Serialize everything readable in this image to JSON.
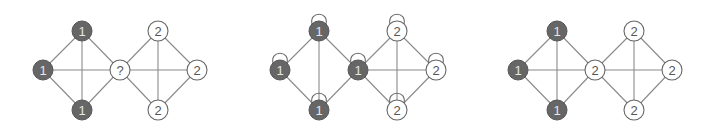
{
  "colors": {
    "dark_node_fill": "#666666",
    "light_node_fill": "#ffffff",
    "edge": "#8a8a8a"
  },
  "node_radius": 10,
  "graphs": [
    {
      "name": "graph-before",
      "nodes": [
        {
          "id": "a",
          "label": "1",
          "x": 82,
          "y": 31,
          "dark": true,
          "loop": false
        },
        {
          "id": "b",
          "label": "1",
          "x": 43,
          "y": 70,
          "dark": true,
          "loop": false
        },
        {
          "id": "c",
          "label": "1",
          "x": 82,
          "y": 110,
          "dark": true,
          "loop": false
        },
        {
          "id": "d",
          "label": "?",
          "x": 120,
          "y": 70,
          "dark": false,
          "loop": false
        },
        {
          "id": "e",
          "label": "2",
          "x": 158,
          "y": 31,
          "dark": false,
          "loop": false
        },
        {
          "id": "f",
          "label": "2",
          "x": 197,
          "y": 70,
          "dark": false,
          "loop": false
        },
        {
          "id": "g",
          "label": "2",
          "x": 158,
          "y": 110,
          "dark": false,
          "loop": false
        }
      ],
      "edges": [
        [
          "a",
          "b"
        ],
        [
          "a",
          "c"
        ],
        [
          "a",
          "d"
        ],
        [
          "b",
          "c"
        ],
        [
          "b",
          "d"
        ],
        [
          "c",
          "d"
        ],
        [
          "d",
          "e"
        ],
        [
          "d",
          "f"
        ],
        [
          "d",
          "g"
        ],
        [
          "e",
          "g"
        ],
        [
          "e",
          "f"
        ],
        [
          "f",
          "g"
        ]
      ]
    },
    {
      "name": "graph-with-self-loops",
      "nodes": [
        {
          "id": "a",
          "label": "1",
          "x": 319,
          "y": 31,
          "dark": true,
          "loop": true
        },
        {
          "id": "b",
          "label": "1",
          "x": 280,
          "y": 70,
          "dark": true,
          "loop": true
        },
        {
          "id": "c",
          "label": "1",
          "x": 319,
          "y": 110,
          "dark": true,
          "loop": true
        },
        {
          "id": "d",
          "label": "1",
          "x": 358,
          "y": 70,
          "dark": true,
          "loop": true
        },
        {
          "id": "e",
          "label": "2",
          "x": 397,
          "y": 31,
          "dark": false,
          "loop": true
        },
        {
          "id": "f",
          "label": "2",
          "x": 436,
          "y": 70,
          "dark": false,
          "loop": true
        },
        {
          "id": "g",
          "label": "2",
          "x": 397,
          "y": 110,
          "dark": false,
          "loop": true
        }
      ],
      "edges": [
        [
          "a",
          "b"
        ],
        [
          "a",
          "c"
        ],
        [
          "a",
          "d"
        ],
        [
          "b",
          "c"
        ],
        [
          "c",
          "d"
        ],
        [
          "d",
          "e"
        ],
        [
          "d",
          "f"
        ],
        [
          "d",
          "g"
        ],
        [
          "e",
          "g"
        ],
        [
          "e",
          "f"
        ],
        [
          "f",
          "g"
        ]
      ]
    },
    {
      "name": "graph-after",
      "nodes": [
        {
          "id": "a",
          "label": "1",
          "x": 557,
          "y": 31,
          "dark": true,
          "loop": false
        },
        {
          "id": "b",
          "label": "1",
          "x": 518,
          "y": 70,
          "dark": true,
          "loop": false
        },
        {
          "id": "c",
          "label": "1",
          "x": 557,
          "y": 110,
          "dark": true,
          "loop": false
        },
        {
          "id": "d",
          "label": "2",
          "x": 595,
          "y": 70,
          "dark": false,
          "loop": false
        },
        {
          "id": "e",
          "label": "2",
          "x": 634,
          "y": 31,
          "dark": false,
          "loop": false
        },
        {
          "id": "f",
          "label": "2",
          "x": 672,
          "y": 70,
          "dark": false,
          "loop": false
        },
        {
          "id": "g",
          "label": "2",
          "x": 634,
          "y": 110,
          "dark": false,
          "loop": false
        }
      ],
      "edges": [
        [
          "a",
          "b"
        ],
        [
          "a",
          "c"
        ],
        [
          "a",
          "d"
        ],
        [
          "b",
          "c"
        ],
        [
          "b",
          "d"
        ],
        [
          "c",
          "d"
        ],
        [
          "d",
          "e"
        ],
        [
          "d",
          "f"
        ],
        [
          "d",
          "g"
        ],
        [
          "e",
          "g"
        ],
        [
          "e",
          "f"
        ],
        [
          "f",
          "g"
        ]
      ]
    }
  ]
}
